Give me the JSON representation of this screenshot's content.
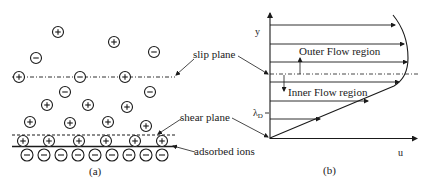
{
  "panel_a": {
    "caption": "(a)",
    "labels": {
      "slip_plane": "slip plane",
      "shear_plane": "shear plane",
      "adsorbed_ions": "adsorbed ions"
    },
    "ions": [
      {
        "sign": "+",
        "x": 58,
        "y": 32
      },
      {
        "sign": "+",
        "x": 114,
        "y": 42
      },
      {
        "sign": "-",
        "x": 36,
        "y": 58
      },
      {
        "sign": "-",
        "x": 154,
        "y": 52
      },
      {
        "sign": "+",
        "x": 19,
        "y": 77
      },
      {
        "sign": "-",
        "x": 80,
        "y": 77
      },
      {
        "sign": "+",
        "x": 125,
        "y": 77
      },
      {
        "sign": "-",
        "x": 65,
        "y": 92
      },
      {
        "sign": "-",
        "x": 150,
        "y": 92
      },
      {
        "sign": "+",
        "x": 47,
        "y": 105
      },
      {
        "sign": "+",
        "x": 88,
        "y": 105
      },
      {
        "sign": "+",
        "x": 127,
        "y": 107
      },
      {
        "sign": "+",
        "x": 30,
        "y": 122
      },
      {
        "sign": "+",
        "x": 70,
        "y": 123
      },
      {
        "sign": "+",
        "x": 108,
        "y": 122
      },
      {
        "sign": "+",
        "x": 146,
        "y": 126
      }
    ],
    "shear_row_ions": [
      {
        "sign": "+",
        "x": 23,
        "y": 141
      },
      {
        "sign": "+",
        "x": 49,
        "y": 141
      },
      {
        "sign": "+",
        "x": 79,
        "y": 141
      },
      {
        "sign": "+",
        "x": 106,
        "y": 141
      },
      {
        "sign": "+",
        "x": 135,
        "y": 141
      },
      {
        "sign": "+",
        "x": 162,
        "y": 141
      }
    ],
    "adsorbed_row_ions": [
      {
        "sign": "-",
        "x": 27,
        "y": 155
      },
      {
        "sign": "-",
        "x": 44,
        "y": 155
      },
      {
        "sign": "-",
        "x": 61,
        "y": 155
      },
      {
        "sign": "-",
        "x": 78,
        "y": 155
      },
      {
        "sign": "-",
        "x": 95,
        "y": 155
      },
      {
        "sign": "-",
        "x": 112,
        "y": 155
      },
      {
        "sign": "-",
        "x": 129,
        "y": 155
      },
      {
        "sign": "-",
        "x": 146,
        "y": 155
      },
      {
        "sign": "-",
        "x": 162,
        "y": 155
      }
    ]
  },
  "panel_b": {
    "caption": "(b)",
    "y_axis_label": "y",
    "x_axis_label": "u",
    "debye_length_label": "λ",
    "debye_length_subscript": "D",
    "outer_region_label": "Outer Flow region",
    "inner_region_label": "Inner Flow region",
    "velocity_arrows": [
      {
        "y": 25,
        "x_end": 395
      },
      {
        "y": 44,
        "x_end": 404
      },
      {
        "y": 62,
        "x_end": 407
      },
      {
        "y": 82,
        "x_end": 399
      },
      {
        "y": 101,
        "x_end": 368
      },
      {
        "y": 119,
        "x_end": 320
      }
    ]
  },
  "colors": {
    "ink": "#1a1a1a",
    "background": "#ffffff"
  }
}
